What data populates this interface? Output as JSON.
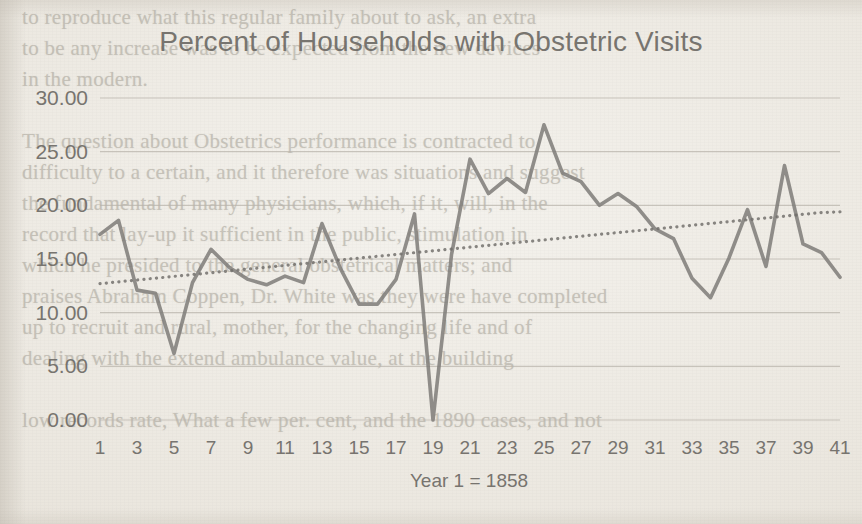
{
  "chart_data": {
    "type": "line",
    "title": "Percent of Households with Obstetric Visits",
    "xlabel": "Year 1 = 1858",
    "ylabel": "",
    "ylim": [
      0,
      30
    ],
    "ytick_step": 5,
    "ytick_labels": [
      "0.00",
      "5.00",
      "10.00",
      "15.00",
      "20.00",
      "25.00",
      "30.00"
    ],
    "yticks": [
      0,
      5,
      10,
      15,
      20,
      25,
      30
    ],
    "xlim": [
      1,
      41
    ],
    "xtick_labels": [
      "1",
      "3",
      "5",
      "7",
      "9",
      "11",
      "13",
      "15",
      "17",
      "19",
      "21",
      "23",
      "25",
      "27",
      "29",
      "31",
      "33",
      "35",
      "37",
      "39",
      "41"
    ],
    "xticks": [
      1,
      3,
      5,
      7,
      9,
      11,
      13,
      15,
      17,
      19,
      21,
      23,
      25,
      27,
      29,
      31,
      33,
      35,
      37,
      39,
      41
    ],
    "grid": "horizontal",
    "legend": "none",
    "x": [
      1,
      2,
      3,
      4,
      5,
      6,
      7,
      8,
      9,
      10,
      11,
      12,
      13,
      14,
      15,
      16,
      17,
      18,
      19,
      20,
      21,
      22,
      23,
      24,
      25,
      26,
      27,
      28,
      29,
      30,
      31,
      32,
      33,
      34,
      35,
      36,
      37,
      38,
      39,
      40,
      41
    ],
    "series": [
      {
        "name": "Percent of Households with Obstetric Visits",
        "color": "#7f7d79",
        "style": "solid",
        "values": [
          17.3,
          18.6,
          12.1,
          11.8,
          6.2,
          12.8,
          15.9,
          14.2,
          13.1,
          12.6,
          13.4,
          12.8,
          18.3,
          14.1,
          10.8,
          10.8,
          13.1,
          19.2,
          0.0,
          15.4,
          24.3,
          21.1,
          22.5,
          21.2,
          27.5,
          23.0,
          22.2,
          20.0,
          21.1,
          19.9,
          17.8,
          16.9,
          13.2,
          11.4,
          15.1,
          19.6,
          14.3,
          23.7,
          16.4,
          15.6,
          13.3
        ]
      },
      {
        "name": "Linear trendline",
        "color": "#6f6d69",
        "style": "dotted",
        "values": [
          12.7,
          12.87,
          13.04,
          13.21,
          13.38,
          13.55,
          13.72,
          13.89,
          14.06,
          14.23,
          14.4,
          14.57,
          14.74,
          14.91,
          15.08,
          15.25,
          15.42,
          15.59,
          15.76,
          15.93,
          16.1,
          16.27,
          16.44,
          16.61,
          16.78,
          16.95,
          17.12,
          17.29,
          17.46,
          17.63,
          17.8,
          17.97,
          18.14,
          18.31,
          18.48,
          18.65,
          18.82,
          18.99,
          19.16,
          19.33,
          19.4
        ]
      }
    ]
  },
  "page_background": {
    "bleed_text": [
      "to reproduce what this regular family about to ask, an extra",
      "to be any increase was to be expected from the new devices",
      "in the modern.",
      "",
      "The question about Obstetrics performance is contracted to",
      "difficulty to a certain, and it therefore was situations and suggest",
      "the fundamental of many physicians, which, if it, will, in the",
      "record that lay-up it sufficient in the public, stimulation in",
      "which he presided to the general obstetrical matters; and",
      "praises Abraham Coppen, Dr. White was they were have completed",
      "up to recruit and rural, mother, for the changing life and of",
      "dealing with the extend ambulance value, at the building",
      "",
      "low records rate, What a few per. cent, and the 1890 cases, and not"
    ]
  },
  "colors": {
    "paper": "#efece6",
    "grid_line": "#b9b4ab",
    "data_line": "#7f7d79",
    "trend_line": "#6f6d69",
    "text": "#6e6b66"
  }
}
